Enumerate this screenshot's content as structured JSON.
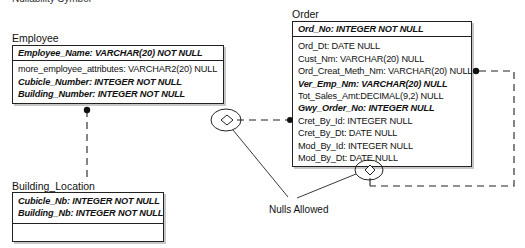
{
  "caption": "Nullability Symbol",
  "entities": {
    "employee": {
      "name": "Employee",
      "primary_key": [
        {
          "text": "Employee_Name: VARCHAR(20) NOT NULL",
          "key": true
        }
      ],
      "attributes": [
        {
          "text": "more_employee_attributes: VARCHAR2(20) NULL",
          "key": false
        },
        {
          "text": "Cubicle_Number: INTEGER NOT NULL",
          "key": true
        },
        {
          "text": "Building_Number: INTEGER NOT NULL",
          "key": true
        }
      ]
    },
    "building_location": {
      "name": "Building_Location",
      "primary_key": [
        {
          "text": "Cubicle_Nb: INTEGER NOT NULL",
          "key": true
        },
        {
          "text": "Building_Nb: INTEGER NOT NULL",
          "key": true
        }
      ],
      "attributes": []
    },
    "order": {
      "name": "Order",
      "primary_key": [
        {
          "text": "Ord_No: INTEGER NOT NULL",
          "key": true
        }
      ],
      "attributes": [
        {
          "text": "Ord_Dt: DATE NULL",
          "key": false
        },
        {
          "text": "Cust_Nm: VARCHAR(20) NULL",
          "key": false
        },
        {
          "text": "Ord_Creat_Meth_Nm: VARCHAR(20) NULL",
          "key": false
        },
        {
          "text": "Ver_Emp_Nm: VARCHAR(20) NULL",
          "key": true
        },
        {
          "text": "Tot_Sales_Amt:DECIMAL(9,2) NULL",
          "key": false
        },
        {
          "text": "Gwy_Order_No: INTEGER NULL",
          "key": true
        },
        {
          "text": "Cret_By_Id: INTEGER NULL",
          "key": false
        },
        {
          "text": "Cret_By_Dt: DATE NULL",
          "key": false
        },
        {
          "text": "Mod_By_Id: INTEGER NULL",
          "key": false
        },
        {
          "text": "Mod_By_Dt: DATE NULL",
          "key": false
        }
      ]
    }
  },
  "annotation": {
    "label": "Nulls Allowed"
  },
  "relationships": [
    {
      "from": "Employee",
      "to": "Building_Location",
      "style": "dashed",
      "nullable": false
    },
    {
      "from": "Employee",
      "to": "Order",
      "style": "dashed",
      "nullable": true
    },
    {
      "from": "Order",
      "to": "Order",
      "style": "dashed",
      "nullable": true
    }
  ]
}
